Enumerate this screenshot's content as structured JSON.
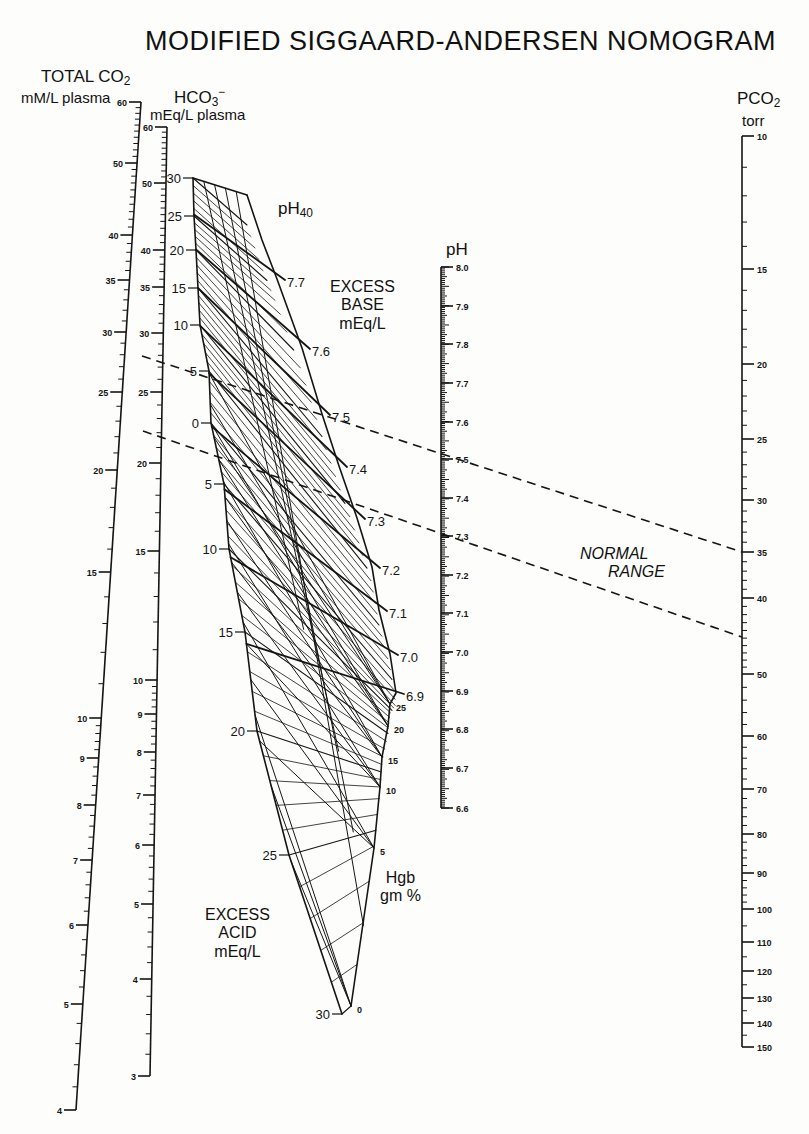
{
  "title": "MODIFIED SIGGAARD-ANDERSEN NOMOGRAM",
  "axes": {
    "total_co2": {
      "label_main": "TOTAL CO",
      "label_sub": "2",
      "unit": "mM/L plasma"
    },
    "hco3": {
      "label_main": "HCO",
      "label_sub": "3",
      "label_sup": "−",
      "unit": "mEq/L plasma"
    },
    "ph": {
      "label": "pH"
    },
    "pco2": {
      "label_main": "PCO",
      "label_sub": "2",
      "unit": "torr"
    }
  },
  "labels": {
    "ph40_main": "pH",
    "ph40_sub": "40",
    "excess_base": [
      "EXCESS",
      "BASE",
      "mEq/L"
    ],
    "excess_acid": [
      "EXCESS",
      "ACID",
      "mEq/L"
    ],
    "hgb": [
      "Hgb",
      "gm %"
    ],
    "normal_range": [
      "NORMAL",
      "RANGE"
    ]
  },
  "colors": {
    "ink": "#151515",
    "paper": "#fdfdfb"
  },
  "chart_data": {
    "type": "nomogram",
    "title": "MODIFIED SIGGAARD-ANDERSEN NOMOGRAM",
    "scales": [
      {
        "name": "Total CO2 (mM/L plasma)",
        "scale": "log",
        "ticks": [
          {
            "v": 60,
            "y": 102
          },
          {
            "v": 50,
            "y": 163
          },
          {
            "v": 40,
            "y": 235
          },
          {
            "v": 35,
            "y": 280
          },
          {
            "v": 30,
            "y": 332
          },
          {
            "v": 25,
            "y": 392
          },
          {
            "v": 20,
            "y": 470
          },
          {
            "v": 15,
            "y": 572
          },
          {
            "v": 10,
            "y": 718
          },
          {
            "v": 9,
            "y": 758
          },
          {
            "v": 8,
            "y": 805
          },
          {
            "v": 7,
            "y": 860
          },
          {
            "v": 6,
            "y": 925
          },
          {
            "v": 5,
            "y": 1004
          },
          {
            "v": 4,
            "y": 1110
          }
        ],
        "line": {
          "x_top": 141,
          "y_top": 102,
          "x_bottom": 76,
          "y_bottom": 1110
        }
      },
      {
        "name": "HCO3- (mEq/L plasma)",
        "scale": "log",
        "ticks": [
          {
            "v": 60,
            "y": 127
          },
          {
            "v": 50,
            "y": 183
          },
          {
            "v": 40,
            "y": 250
          },
          {
            "v": 35,
            "y": 287
          },
          {
            "v": 30,
            "y": 333
          },
          {
            "v": 25,
            "y": 392
          },
          {
            "v": 20,
            "y": 463
          },
          {
            "v": 15,
            "y": 551
          },
          {
            "v": 10,
            "y": 680
          },
          {
            "v": 9,
            "y": 714
          },
          {
            "v": 8,
            "y": 752
          },
          {
            "v": 7,
            "y": 795
          },
          {
            "v": 6,
            "y": 845
          },
          {
            "v": 5,
            "y": 904
          },
          {
            "v": 4,
            "y": 979
          },
          {
            "v": 3,
            "y": 1076
          }
        ],
        "line": {
          "x_top": 167,
          "y_top": 127,
          "x_bottom": 150,
          "y_bottom": 1076
        }
      },
      {
        "name": "pH",
        "scale": "linear",
        "ticks": [
          {
            "v": "8.0",
            "y": 267
          },
          {
            "v": "7.9",
            "y": 306
          },
          {
            "v": "7.8",
            "y": 344
          },
          {
            "v": "7.7",
            "y": 383
          },
          {
            "v": "7.6",
            "y": 422
          },
          {
            "v": "7.5",
            "y": 459
          },
          {
            "v": "7.4",
            "y": 498
          },
          {
            "v": "7.3",
            "y": 536
          },
          {
            "v": "7.2",
            "y": 575
          },
          {
            "v": "7.1",
            "y": 613
          },
          {
            "v": "7.0",
            "y": 652
          },
          {
            "v": "6.9",
            "y": 691
          },
          {
            "v": "6.8",
            "y": 729
          },
          {
            "v": "6.7",
            "y": 768
          },
          {
            "v": "6.6",
            "y": 808
          }
        ],
        "line": {
          "x": 441,
          "y_top": 267,
          "y_bottom": 808
        }
      },
      {
        "name": "PCO2 (torr)",
        "scale": "log",
        "ticks": [
          {
            "v": 10,
            "y": 136
          },
          {
            "v": 15,
            "y": 269
          },
          {
            "v": 20,
            "y": 364
          },
          {
            "v": 25,
            "y": 439
          },
          {
            "v": 30,
            "y": 500
          },
          {
            "v": 35,
            "y": 552
          },
          {
            "v": 40,
            "y": 598
          },
          {
            "v": 50,
            "y": 674
          },
          {
            "v": 60,
            "y": 736
          },
          {
            "v": 70,
            "y": 789
          },
          {
            "v": 80,
            "y": 834
          },
          {
            "v": 90,
            "y": 873
          },
          {
            "v": 100,
            "y": 909
          },
          {
            "v": 110,
            "y": 942
          },
          {
            "v": 120,
            "y": 971
          },
          {
            "v": 130,
            "y": 998
          },
          {
            "v": 140,
            "y": 1023
          },
          {
            "v": 150,
            "y": 1047
          }
        ],
        "line": {
          "x": 742,
          "y_top": 136,
          "y_bottom": 1047
        }
      }
    ],
    "excess_base_labels": [
      {
        "v": "30",
        "x": 181,
        "y": 178
      },
      {
        "v": "25",
        "x": 182,
        "y": 216
      },
      {
        "v": "20",
        "x": 184,
        "y": 250
      },
      {
        "v": "15",
        "x": 186,
        "y": 288
      },
      {
        "v": "10",
        "x": 188,
        "y": 325
      },
      {
        "v": "5",
        "x": 197,
        "y": 371
      },
      {
        "v": "0",
        "x": 199,
        "y": 423
      },
      {
        "v": "5",
        "x": 212,
        "y": 484
      },
      {
        "v": "10",
        "x": 217,
        "y": 549
      },
      {
        "v": "15",
        "x": 233,
        "y": 632
      },
      {
        "v": "20",
        "x": 245,
        "y": 731
      },
      {
        "v": "25",
        "x": 277,
        "y": 855
      },
      {
        "v": "30",
        "x": 330,
        "y": 1014
      }
    ],
    "ph40_isopleths": [
      {
        "v": "7.7",
        "x": 287,
        "y": 283
      },
      {
        "v": "7.6",
        "x": 312,
        "y": 352
      },
      {
        "v": "7.5",
        "x": 332,
        "y": 418
      },
      {
        "v": "7.4",
        "x": 349,
        "y": 470
      },
      {
        "v": "7.3",
        "x": 367,
        "y": 522
      },
      {
        "v": "7.2",
        "x": 382,
        "y": 571
      },
      {
        "v": "7.1",
        "x": 389,
        "y": 614
      },
      {
        "v": "7.0",
        "x": 400,
        "y": 658
      },
      {
        "v": "6.9",
        "x": 406,
        "y": 697
      }
    ],
    "hgb_scale": [
      {
        "v": "25",
        "x": 396,
        "y": 708
      },
      {
        "v": "20",
        "x": 394,
        "y": 730
      },
      {
        "v": "15",
        "x": 388,
        "y": 761
      },
      {
        "v": "10",
        "x": 386,
        "y": 791
      },
      {
        "v": "5",
        "x": 380,
        "y": 852
      },
      {
        "v": "0",
        "x": 357,
        "y": 1010
      }
    ],
    "normal_range": {
      "lines": [
        {
          "from": {
            "x": 142,
            "y": 356
          },
          "to": {
            "x": 742,
            "y": 552
          }
        },
        {
          "from": {
            "x": 143,
            "y": 431
          },
          "to": {
            "x": 742,
            "y": 637
          }
        }
      ],
      "pco2_range_torr": [
        35,
        45
      ],
      "total_co2_range": [
        22,
        28
      ]
    }
  }
}
